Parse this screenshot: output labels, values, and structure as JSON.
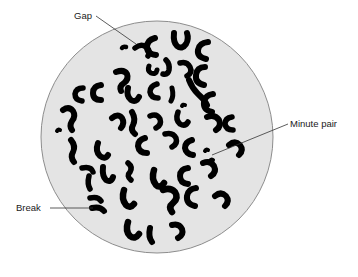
{
  "figure": {
    "field_shape": "circle",
    "field": {
      "center_x": 157,
      "center_y": 137,
      "radius": 116,
      "fill_color": "#e4e4e4",
      "stroke_color": "#8d8d8d"
    },
    "chromosome_color": "#000000",
    "background_color": "#ffffff",
    "leader_line_color": "#333333"
  },
  "labels": [
    {
      "id": "gap",
      "text": "Gap",
      "text_x": 74,
      "text_y": 19,
      "anchor": "start",
      "leader": [
        [
          96,
          16
        ],
        [
          136,
          44
        ]
      ],
      "target_x": 136,
      "target_y": 44
    },
    {
      "id": "minute-pair",
      "text": "Minute pair",
      "text_x": 290,
      "text_y": 127,
      "anchor": "start",
      "leader": [
        [
          288,
          124
        ],
        [
          212,
          155
        ]
      ],
      "target_x": 212,
      "target_y": 155
    },
    {
      "id": "break",
      "text": "Break",
      "text_x": 16,
      "text_y": 211,
      "anchor": "start",
      "leader": [
        [
          50,
          208
        ],
        [
          93,
          208
        ]
      ],
      "target_x": 93,
      "target_y": 208
    }
  ],
  "chromosomes": [
    {
      "name": "chr-01",
      "d": "M135,48 q6,-5 11,-1 q5,4 2,9",
      "w": 5.5
    },
    {
      "name": "chr-02",
      "d": "M126,47 q-3,-1 -4,1",
      "w": 4.5
    },
    {
      "name": "chr-03",
      "d": "M155,38 q-8,2 -8,9 q0,7 9,8",
      "w": 6
    },
    {
      "name": "chr-04",
      "d": "M174,33 q-1,9 3,13 q5,4 9,-2 q3,-5 1,-11",
      "w": 6
    },
    {
      "name": "chr-05",
      "d": "M208,42 q-9,1 -10,8 q-1,7 8,9",
      "w": 6
    },
    {
      "name": "chr-06",
      "d": "M116,72 q8,-3 11,2 q2,5 -3,9 q-5,3 -3,8",
      "w": 6
    },
    {
      "name": "chr-07",
      "d": "M149,66 q-2,5 2,7 q5,2 6,-3",
      "w": 5
    },
    {
      "name": "chr-08",
      "d": "M166,60 q4,4 3,10 q-1,5 -6,4",
      "w": 5.5
    },
    {
      "name": "chr-09",
      "d": "M180,63 q7,-2 10,4 q3,6 -3,9",
      "w": 5.5
    },
    {
      "name": "chr-10",
      "d": "M205,67 q-8,0 -9,8 q-1,8 8,10",
      "w": 6
    },
    {
      "name": "chr-11",
      "d": "M83,88 q-7,0 -8,6 q0,6 7,7",
      "w": 5.5
    },
    {
      "name": "chr-12",
      "d": "M101,85 q-8,1 -8,8 q0,7 8,7",
      "w": 6
    },
    {
      "name": "chr-13",
      "d": "M128,88 q-2,8 3,12 q5,3 8,-3",
      "w": 6
    },
    {
      "name": "chr-14",
      "d": "M157,84 q-7,2 -7,8 q1,6 8,6",
      "w": 5.5
    },
    {
      "name": "chr-15",
      "d": "M172,88 q2,8 -1,13",
      "w": 5
    },
    {
      "name": "chr-16",
      "d": "M189,80 q3,8 9,14 q6,5 9,11",
      "w": 6
    },
    {
      "name": "chr-17",
      "d": "M213,94 q-8,1 -9,8 q-1,8 8,10",
      "w": 6
    },
    {
      "name": "chr-18",
      "d": "M63,110 q6,-4 10,1 q3,5 -1,10 q-3,5 0,9",
      "w": 6
    },
    {
      "name": "chr-19",
      "d": "M112,118 q6,-5 10,0 q3,5 -1,10",
      "w": 6
    },
    {
      "name": "chr-20",
      "d": "M132,112 q4,7 1,13 q-3,5 2,9",
      "w": 6
    },
    {
      "name": "chr-21",
      "d": "M150,116 q7,-3 10,3 q2,6 -4,9",
      "w": 5.5
    },
    {
      "name": "chr-22",
      "d": "M178,112 q-3,8 2,12 q5,3 8,-2",
      "w": 5.5
    },
    {
      "name": "chr-23",
      "d": "M207,117 q8,-3 12,3 q3,6 -3,10",
      "w": 6
    },
    {
      "name": "chr-24",
      "d": "M232,117 q-7,1 -7,7 q1,6 8,6",
      "w": 5.5
    },
    {
      "name": "chr-25",
      "d": "M71,140 q5,6 2,12 q-3,5 1,10",
      "w": 6
    },
    {
      "name": "chr-26",
      "d": "M98,143 q-3,8 2,13 q5,4 8,-1",
      "w": 6
    },
    {
      "name": "chr-27",
      "d": "M145,138 q-7,2 -7,8 q1,7 9,7",
      "w": 6
    },
    {
      "name": "chr-28",
      "d": "M165,134 q8,-2 11,4 q2,6 -4,9",
      "w": 5.5
    },
    {
      "name": "chr-29",
      "d": "M192,140 q-7,2 -7,8 q1,6 8,7",
      "w": 6
    },
    {
      "name": "chr-30",
      "d": "M208,150 q-2,-1 -3,1",
      "w": 4
    },
    {
      "name": "chr-31",
      "d": "M213,160 q-2,-1 -3,1",
      "w": 4
    },
    {
      "name": "chr-32",
      "d": "M229,145 q6,-5 11,0 q4,5 -1,10",
      "w": 6
    },
    {
      "name": "chr-33",
      "d": "M82,168 q9,-2 11,4",
      "w": 5.5
    },
    {
      "name": "chr-34",
      "d": "M89,176 q-2,8 1,13",
      "w": 5.5
    },
    {
      "name": "chr-35",
      "d": "M103,167 q-1,9 3,13 q5,3 7,-3",
      "w": 6
    },
    {
      "name": "chr-36",
      "d": "M128,163 q5,4 2,9 q-4,4 1,8",
      "w": 5.5
    },
    {
      "name": "chr-37",
      "d": "M154,170 q-3,9 2,15 q4,4 8,-2",
      "w": 6.5
    },
    {
      "name": "chr-38",
      "d": "M188,168 q-8,1 -8,8 q0,7 8,8",
      "w": 6
    },
    {
      "name": "chr-39",
      "d": "M203,163 q7,-3 11,3 q3,6 -3,10",
      "w": 6
    },
    {
      "name": "chr-40",
      "d": "M90,198 q8,-2 11,3",
      "w": 5.5
    },
    {
      "name": "chr-41",
      "d": "M92,208 q8,-2 12,3",
      "w": 6
    },
    {
      "name": "chr-42",
      "d": "M124,190 q-3,9 2,15 q4,4 8,-1",
      "w": 6.5
    },
    {
      "name": "chr-43",
      "d": "M163,190 q7,-3 12,2 q4,6 -2,11 q-5,4 -1,9",
      "w": 6.5
    },
    {
      "name": "chr-44",
      "d": "M196,188 q-8,1 -9,8 q-1,8 8,10",
      "w": 6
    },
    {
      "name": "chr-45",
      "d": "M215,196 q6,-5 11,0 q4,5 -1,10",
      "w": 6
    },
    {
      "name": "chr-46",
      "d": "M128,222 q-3,9 2,14 q5,4 9,-2",
      "w": 6.5
    },
    {
      "name": "chr-47",
      "d": "M150,228 q-2,9 2,14",
      "w": 6
    },
    {
      "name": "chr-48",
      "d": "M172,225 q7,-2 10,4 q2,6 -4,9",
      "w": 6
    },
    {
      "name": "chr-49",
      "d": "M60,130 q-2,-1 -3,1",
      "w": 4
    },
    {
      "name": "chr-50",
      "d": "M185,105 q-2,-1 -3,1",
      "w": 4
    }
  ]
}
